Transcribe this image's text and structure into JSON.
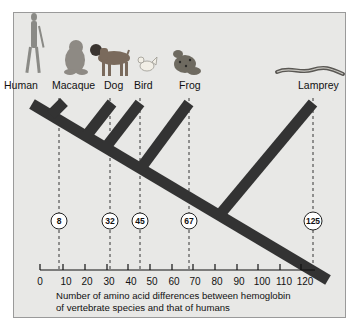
{
  "diagram": {
    "type": "phylogenetic-tree",
    "species": [
      {
        "name": "Human",
        "differences": 0
      },
      {
        "name": "Macaque",
        "differences": 8
      },
      {
        "name": "Dog",
        "differences": 32
      },
      {
        "name": "Bird",
        "differences": 45
      },
      {
        "name": "Frog",
        "differences": 67
      },
      {
        "name": "Lamprey",
        "differences": 125
      }
    ],
    "labels": {
      "human": "Human",
      "macaque": "Macaque",
      "dog": "Dog",
      "bird": "Bird",
      "frog": "Frog",
      "lamprey": "Lamprey"
    },
    "markers": {
      "macaque": "8",
      "dog": "32",
      "bird": "45",
      "frog": "67",
      "lamprey": "125"
    },
    "axis": {
      "ticks": [
        "0",
        "10",
        "20",
        "30",
        "40",
        "50",
        "60",
        "70",
        "80",
        "90",
        "100",
        "110",
        "120"
      ],
      "caption_line1": "Number of amino acid differences between hemoglobin",
      "caption_line2": "of vertebrate species and that of humans"
    },
    "colors": {
      "panel_bg": "#e8e8e6",
      "branch": "#333333",
      "text": "#111111"
    }
  }
}
